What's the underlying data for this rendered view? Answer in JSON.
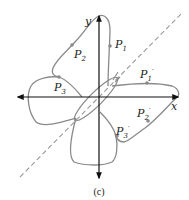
{
  "figure": {
    "caption": "(c)",
    "axes": {
      "x_label": "x",
      "y_label": "y"
    },
    "symmetry_line": "dashed line y = x",
    "points": [
      {
        "id": "P1",
        "base": "P",
        "sub": "1",
        "prime": ""
      },
      {
        "id": "P2",
        "base": "P",
        "sub": "2",
        "prime": ""
      },
      {
        "id": "P3",
        "base": "P",
        "sub": "3",
        "prime": ""
      },
      {
        "id": "P1'",
        "base": "P",
        "sub": "1",
        "prime": "′"
      },
      {
        "id": "P2'",
        "base": "P",
        "sub": "2",
        "prime": "′"
      },
      {
        "id": "P3'",
        "base": "P",
        "sub": "3",
        "prime": "′"
      }
    ]
  },
  "colors": {
    "curve": "#8a8a8a",
    "axis": "#111111",
    "dashed": "#9a9a9a",
    "point": "#8a8a8a"
  }
}
